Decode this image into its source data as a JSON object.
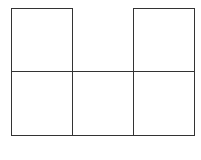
{
  "diagram": {
    "line_color": "#333333",
    "cells": [
      {
        "id": "top-left",
        "row": 0,
        "col": 0
      },
      {
        "id": "top-right",
        "row": 0,
        "col": 2
      },
      {
        "id": "bottom-left",
        "row": 1,
        "col": 0
      },
      {
        "id": "bottom-middle",
        "row": 1,
        "col": 1
      },
      {
        "id": "bottom-right",
        "row": 1,
        "col": 2
      }
    ]
  }
}
